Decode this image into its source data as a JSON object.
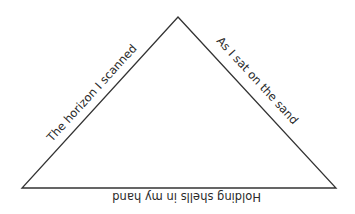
{
  "diagram": {
    "type": "triangle-poem",
    "stroke_color": "#333333",
    "background": "#ffffff",
    "sides": {
      "left": {
        "text": "The horizon I scanned"
      },
      "right": {
        "text": "As I sat on the sand"
      },
      "bottom": {
        "text": "Holding shells in my hand",
        "orientation": "upside-down"
      }
    }
  }
}
